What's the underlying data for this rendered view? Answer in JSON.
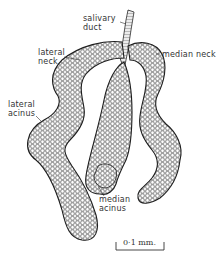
{
  "figure": {
    "background_color": "#ffffff",
    "ink_color": "#2a2a2a",
    "labels": {
      "salivary_duct": "salivary\nduct",
      "lateral_neck": "lateral\nneck",
      "median_neck": "median neck",
      "lateral_acinus": "lateral\nacinus",
      "median_acinus": "median\nacinus"
    },
    "scale_bar": {
      "label": "0·1 mm."
    }
  }
}
